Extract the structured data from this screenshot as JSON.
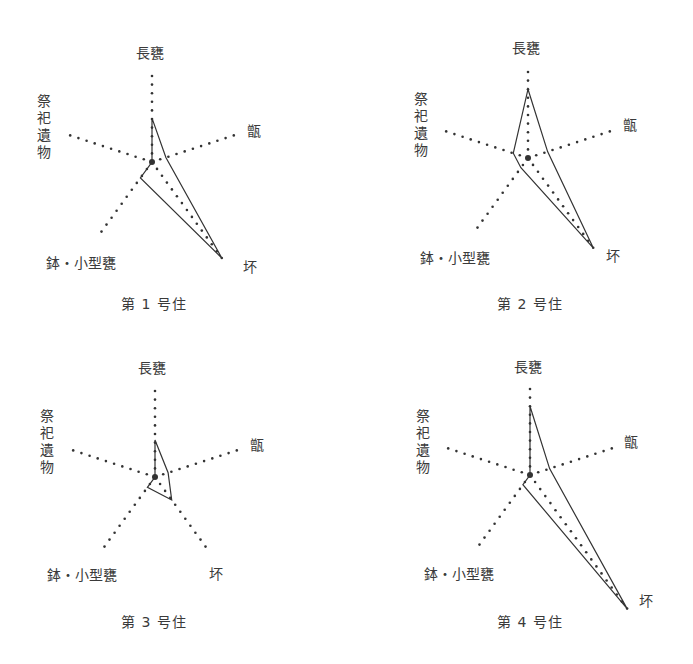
{
  "chart_data": [
    {
      "type": "radar",
      "title": "第 1 号住",
      "axes": [
        "長甕",
        "甑",
        "坏",
        "鉢・小型甕",
        "祭祀遺物"
      ],
      "values": [
        51,
        17,
        138,
        23,
        0
      ],
      "unit_note": "relative scale; axis length = 100",
      "center": [
        152,
        162
      ]
    },
    {
      "type": "radar",
      "title": "第 2 号住",
      "axes": [
        "長甕",
        "甑",
        "坏",
        "鉢・小型甕",
        "祭祀遺物"
      ],
      "values": [
        80,
        24,
        129,
        14,
        18
      ],
      "unit_note": "relative scale; axis length = 100",
      "center": [
        528,
        158
      ]
    },
    {
      "type": "radar",
      "title": "第 3 号住",
      "axes": [
        "長甕",
        "甑",
        "坏",
        "鉢・小型甕",
        "祭祀遺物"
      ],
      "values": [
        43,
        16,
        33,
        15,
        0
      ],
      "unit_note": "relative scale; axis length = 100",
      "center": [
        155,
        477
      ]
    },
    {
      "type": "radar",
      "title": "第 4 号住",
      "axes": [
        "長甕",
        "甑",
        "坏",
        "鉢・小型甕",
        "祭祀遺物"
      ],
      "values": [
        80,
        24,
        192,
        14,
        0
      ],
      "unit_note": "relative scale; axis length = 100",
      "center": [
        530,
        475
      ]
    }
  ],
  "style": {
    "axis_radius_px": 86,
    "line_color": "#333333",
    "dot_color": "#333333"
  },
  "labels": {
    "axis_0": "長甕",
    "axis_1": "甑",
    "axis_2": "坏",
    "axis_3": "鉢・小型甕",
    "axis_4": "祭祀遺物"
  },
  "titles": [
    "第 1 号住",
    "第 2 号住",
    "第 3 号住",
    "第 4 号住"
  ]
}
